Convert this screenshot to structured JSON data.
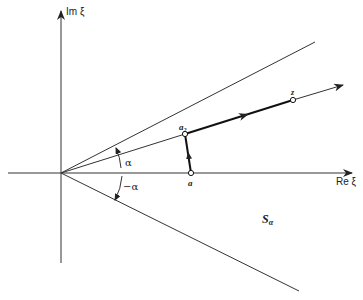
{
  "diagram": {
    "axes": {
      "vertical_label": "Im ξ",
      "horizontal_label": "Re ξ"
    },
    "angles": {
      "upper": "α",
      "lower": "−α"
    },
    "points": {
      "a": "a",
      "a2_base": "a",
      "a2_sub": "2",
      "z": "z"
    },
    "region": {
      "label_base": "S",
      "label_sub": "α"
    },
    "colors": {
      "ink": "#222222",
      "background": "#ffffff"
    }
  }
}
